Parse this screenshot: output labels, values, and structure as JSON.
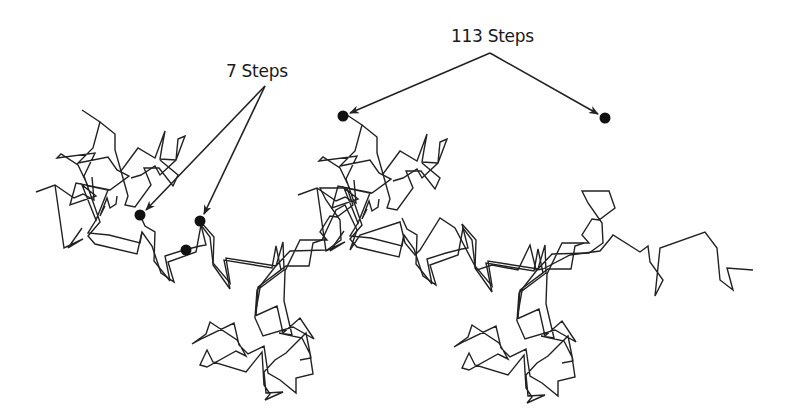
{
  "diagram": {
    "type": "random-walk-self-similarity",
    "labels": {
      "short": "7 Steps",
      "long": "113 Steps"
    },
    "colors": {
      "line": "#222222",
      "dot": "#111111",
      "background": "#ffffff"
    },
    "annotations": [
      {
        "label": "7 Steps",
        "points_to": [
          "dot-a",
          "dot-b"
        ],
        "apex": [
          266,
          86
        ]
      },
      {
        "label": "113 Steps",
        "points_to": [
          "dot-c",
          "dot-d"
        ],
        "apex": [
          490,
          53
        ]
      }
    ],
    "dots": [
      {
        "id": "dot-a",
        "x": 140,
        "y": 215
      },
      {
        "id": "dot-b",
        "x": 200,
        "y": 221
      },
      {
        "id": "dot-c",
        "x": 186,
        "y": 250
      },
      {
        "id": "dot-d",
        "x": 343,
        "y": 116
      },
      {
        "id": "dot-e",
        "x": 605,
        "y": 118
      }
    ],
    "copy_offset": {
      "dx": 262,
      "dy": 3
    }
  }
}
